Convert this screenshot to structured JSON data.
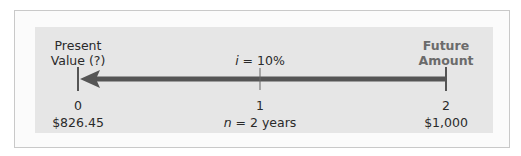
{
  "diagram": {
    "start_label_line1": "Present",
    "start_label_line2": "Value (?)",
    "end_label_line1": "Future",
    "end_label_line2": "Amount",
    "rate_var": "i",
    "rate_text": " = 10%",
    "periods": [
      "0",
      "1",
      "2"
    ],
    "present_value": "$826.45",
    "duration_var": "n",
    "duration_text": " = 2 years",
    "future_value": "$1,000",
    "arrow_direction": "left",
    "colors": {
      "panel": "#e6e6e6",
      "arrow": "#555555",
      "end_label": "#6b6b6b"
    }
  }
}
